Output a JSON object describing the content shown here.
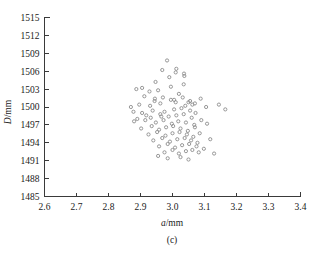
{
  "figure": {
    "caption": "(c)",
    "background_color": "#ffffff",
    "marker_color": "#8c8c8c",
    "axis_color": "#3a3a3a"
  },
  "chart_data": {
    "type": "scatter",
    "title": "",
    "subtitle": "",
    "xlabel": "a/mm",
    "ylabel": "D/mm",
    "xlabel_italic_part": "a",
    "xlabel_unit_part": "/mm",
    "ylabel_italic_part": "D",
    "ylabel_unit_part": "/mm",
    "caption": "(c)",
    "grid": false,
    "legend": false,
    "legend_position": "none",
    "xlim": [
      2.6,
      3.4
    ],
    "ylim": [
      1485,
      1515
    ],
    "xticks": [
      2.6,
      2.7,
      2.8,
      2.9,
      3.0,
      3.1,
      3.2,
      3.3,
      3.4
    ],
    "xtick_labels": [
      "2.6",
      "2.7",
      "2.8",
      "2.9",
      "3.0",
      "3.1",
      "3.2",
      "3.3",
      "3.4"
    ],
    "yticks": [
      1485,
      1488,
      1491,
      1494,
      1497,
      1500,
      1503,
      1506,
      1509,
      1512,
      1515
    ],
    "ytick_labels": [
      "1485",
      "1488",
      "1491",
      "1494",
      "1497",
      "1500",
      "1503",
      "1506",
      "1509",
      "1512",
      "1515"
    ],
    "marker": "open-circle",
    "marker_size": 3.2,
    "series": [
      {
        "name": "samples",
        "x": [
          2.983,
          2.99,
          2.947,
          3.01,
          3.036,
          3.037,
          2.887,
          2.905,
          2.995,
          2.928,
          2.955,
          3.02,
          2.896,
          2.87,
          2.93,
          2.962,
          3.05,
          3.062,
          2.995,
          2.944,
          2.905,
          2.938,
          2.975,
          3.005,
          3.028,
          3.055,
          3.072,
          2.918,
          2.962,
          2.988,
          3.012,
          3.035,
          3.06,
          2.88,
          2.915,
          2.948,
          2.972,
          2.998,
          3.018,
          3.042,
          3.068,
          3.09,
          2.902,
          2.935,
          2.958,
          2.98,
          3.002,
          3.025,
          3.048,
          3.07,
          3.108,
          2.925,
          2.952,
          2.978,
          3.0,
          3.022,
          3.045,
          3.065,
          3.085,
          2.94,
          2.968,
          2.992,
          3.015,
          3.038,
          3.058,
          3.078,
          3.118,
          2.958,
          2.985,
          3.008,
          3.03,
          3.052,
          3.075,
          3.098,
          2.975,
          3.0,
          3.02,
          3.042,
          3.062,
          3.082,
          3.13,
          2.912,
          2.945,
          2.97,
          3.005,
          3.032,
          3.055,
          3.088,
          2.89,
          2.932,
          2.965,
          3.01,
          3.04,
          3.07,
          3.105,
          2.955,
          2.985,
          3.025,
          3.05,
          3.165,
          2.878,
          3.145,
          3.012,
          2.968,
          3.035
        ],
        "y": [
          1507.8,
          1505.0,
          1504.2,
          1505.8,
          1505.6,
          1505.2,
          1503.0,
          1503.2,
          1503.4,
          1502.6,
          1502.8,
          1502.2,
          1500.4,
          1500.0,
          1500.2,
          1500.6,
          1500.8,
          1500.4,
          1501.2,
          1501.0,
          1499.0,
          1499.4,
          1499.2,
          1499.6,
          1499.8,
          1499.4,
          1499.0,
          1498.6,
          1498.8,
          1498.4,
          1498.6,
          1498.8,
          1498.2,
          1497.6,
          1497.8,
          1497.4,
          1497.8,
          1497.2,
          1497.6,
          1497.4,
          1497.0,
          1497.8,
          1496.4,
          1496.8,
          1496.2,
          1496.6,
          1496.8,
          1496.4,
          1496.0,
          1496.6,
          1497.2,
          1495.4,
          1495.8,
          1495.2,
          1495.6,
          1495.8,
          1495.4,
          1495.0,
          1495.6,
          1494.4,
          1494.8,
          1494.2,
          1494.6,
          1494.8,
          1494.4,
          1494.0,
          1494.6,
          1493.4,
          1493.8,
          1493.2,
          1493.6,
          1493.8,
          1493.4,
          1493.0,
          1492.4,
          1492.8,
          1492.2,
          1492.6,
          1492.8,
          1492.4,
          1492.2,
          1501.8,
          1501.4,
          1501.6,
          1501.2,
          1501.6,
          1501.0,
          1501.4,
          1498.0,
          1498.2,
          1498.4,
          1500.8,
          1500.2,
          1500.6,
          1500.0,
          1491.8,
          1491.4,
          1491.6,
          1491.2,
          1499.6,
          1499.2,
          1500.4,
          1506.4,
          1506.2,
          1503.8
        ]
      }
    ]
  }
}
